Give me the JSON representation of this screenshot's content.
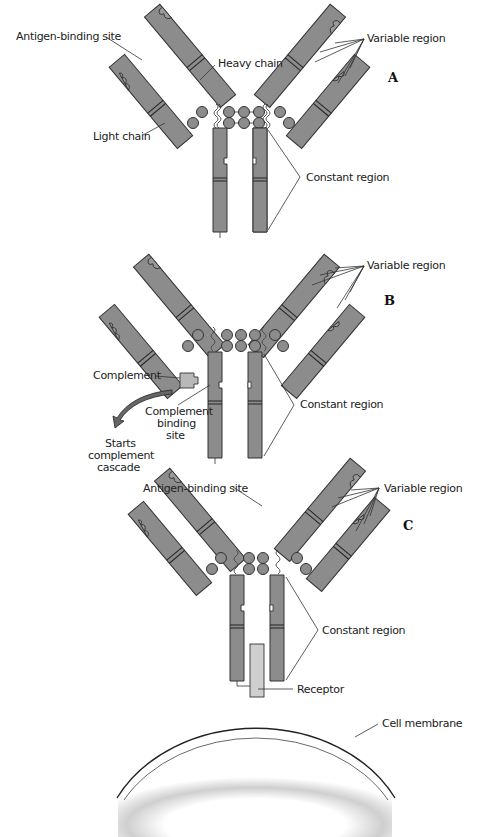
{
  "figure": {
    "panels": [
      {
        "id": "A",
        "panel_label": "A",
        "labels": {
          "antigen_binding_site": "Antigen-binding site",
          "heavy_chain": "Heavy chain",
          "light_chain": "Light chain",
          "variable_region": "Variable region",
          "constant_region": "Constant region"
        }
      },
      {
        "id": "B",
        "panel_label": "B",
        "labels": {
          "variable_region": "Variable region",
          "constant_region": "Constant region",
          "complement": "Complement",
          "complement_binding_site_1": "Complement",
          "complement_binding_site_2": "binding",
          "complement_binding_site_3": "site",
          "cascade_1": "Starts",
          "cascade_2": "complement",
          "cascade_3": "cascade"
        }
      },
      {
        "id": "C",
        "panel_label": "C",
        "labels": {
          "antigen_binding_site": "Antigen-binding site",
          "variable_region": "Variable region",
          "constant_region": "Constant region",
          "receptor": "Receptor",
          "cell_membrane": "Cell membrane"
        }
      }
    ],
    "colors": {
      "chain_fill": "#8c8c8c",
      "complement_fill": "#b8b8b8",
      "receptor_fill": "#cfcfcf",
      "outline": "#333333",
      "cell_shade": "#c8c8c8"
    }
  }
}
